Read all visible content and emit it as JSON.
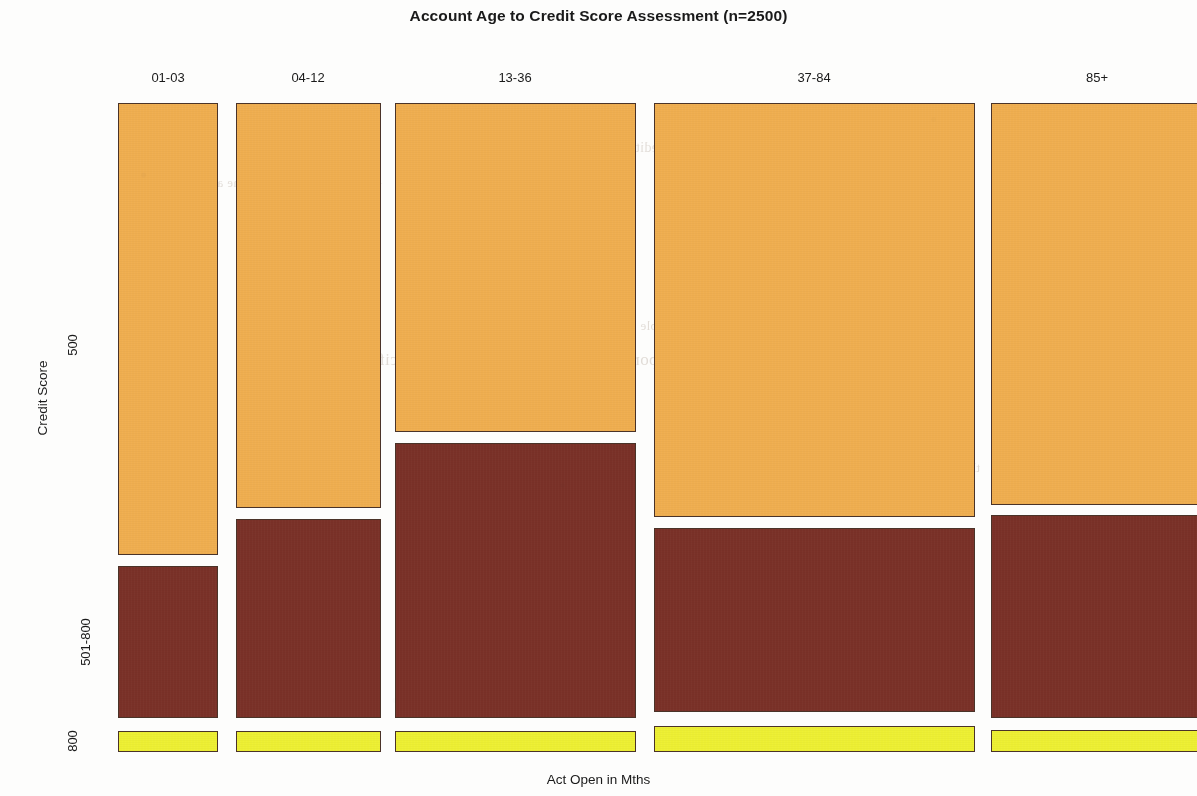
{
  "chart_data": {
    "type": "mosaic",
    "title": "Account Age to Credit Score Assessment (n=2500)",
    "xlabel": "Act Open in Mths",
    "ylabel": "Credit Score",
    "n": 2500,
    "grid": false,
    "legend": "none",
    "categories": [
      "01-03",
      "04-12",
      "13-36",
      "37-84",
      "85+"
    ],
    "row_levels": [
      "500",
      "501-800",
      "800"
    ],
    "column_widths_pct": [
      9.4,
      13.6,
      22.7,
      30.2,
      19.4
    ],
    "series": [
      {
        "name": "500",
        "color": "#efae50",
        "values": [
          70.0,
          62.5,
          50.6,
          63.9,
          62.0
        ]
      },
      {
        "name": "501-800",
        "color": "#7a3128",
        "values": [
          26.6,
          33.2,
          44.9,
          32.4,
          34.1
        ]
      },
      {
        "name": "800",
        "color": "#edef33",
        "values": [
          3.4,
          4.3,
          4.5,
          3.7,
          3.9
        ]
      }
    ],
    "tiles": [
      {
        "col": "01-03",
        "row": "500",
        "x": 118,
        "w": 100,
        "y": 103,
        "h": 452,
        "color": "#efae50"
      },
      {
        "col": "01-03",
        "row": "501-800",
        "x": 118,
        "w": 100,
        "y": 566,
        "h": 152,
        "color": "#7a3128"
      },
      {
        "col": "01-03",
        "row": "800",
        "x": 118,
        "w": 100,
        "y": 731,
        "h": 21,
        "color": "#edef33"
      },
      {
        "col": "04-12",
        "row": "500",
        "x": 236,
        "w": 145,
        "y": 103,
        "h": 405,
        "color": "#efae50"
      },
      {
        "col": "04-12",
        "row": "501-800",
        "x": 236,
        "w": 145,
        "y": 519,
        "h": 199,
        "color": "#7a3128"
      },
      {
        "col": "04-12",
        "row": "800",
        "x": 236,
        "w": 145,
        "y": 731,
        "h": 21,
        "color": "#edef33"
      },
      {
        "col": "13-36",
        "row": "500",
        "x": 395,
        "w": 241,
        "y": 103,
        "h": 329,
        "color": "#efae50"
      },
      {
        "col": "13-36",
        "row": "501-800",
        "x": 395,
        "w": 241,
        "y": 443,
        "h": 275,
        "color": "#7a3128"
      },
      {
        "col": "13-36",
        "row": "800",
        "x": 395,
        "w": 241,
        "y": 731,
        "h": 21,
        "color": "#edef33"
      },
      {
        "col": "37-84",
        "row": "500",
        "x": 654,
        "w": 321,
        "y": 103,
        "h": 414,
        "color": "#efae50"
      },
      {
        "col": "37-84",
        "row": "501-800",
        "x": 654,
        "w": 321,
        "y": 528,
        "h": 184,
        "color": "#7a3128"
      },
      {
        "col": "37-84",
        "row": "800",
        "x": 654,
        "w": 321,
        "y": 726,
        "h": 26,
        "color": "#edef33"
      },
      {
        "col": "85+",
        "row": "500",
        "x": 991,
        "w": 212,
        "y": 103,
        "h": 402,
        "color": "#efae50"
      },
      {
        "col": "85+",
        "row": "501-800",
        "x": 991,
        "w": 212,
        "y": 515,
        "h": 203,
        "color": "#7a3128"
      },
      {
        "col": "85+",
        "row": "800",
        "x": 991,
        "w": 212,
        "y": 730,
        "h": 22,
        "color": "#edef33"
      }
    ],
    "xtick_positions": [
      168,
      308,
      515,
      814,
      1097
    ],
    "ytick_positions": [
      345,
      642,
      741
    ],
    "colors": {
      "orange": "#efae50",
      "dark_red": "#7a3128",
      "yellow": "#edef33",
      "tile_border": "#4a3328",
      "text": "#1a1a1a",
      "background": "#fdfdfc"
    }
  },
  "bleed_text": [
    {
      "text": "and the account",
      "x": 180,
      "y": 175,
      "size": 13
    },
    {
      "text": "to determine whether",
      "x": 255,
      "y": 178,
      "size": 14
    },
    {
      "text": "the credit score",
      "x": 600,
      "y": 140,
      "size": 14
    },
    {
      "text": "assessment of the",
      "x": 770,
      "y": 182,
      "size": 15
    },
    {
      "text": "is generally above",
      "x": 790,
      "y": 265,
      "size": 14
    },
    {
      "text": "For a given account, the reports of these is defined, are not specific actions",
      "x": 310,
      "y": 350,
      "size": 17
    },
    {
      "text": "in the table",
      "x": 640,
      "y": 318,
      "size": 13
    },
    {
      "text": "reported",
      "x": 905,
      "y": 420,
      "size": 13
    },
    {
      "text": "the sample",
      "x": 920,
      "y": 460,
      "size": 13
    }
  ]
}
